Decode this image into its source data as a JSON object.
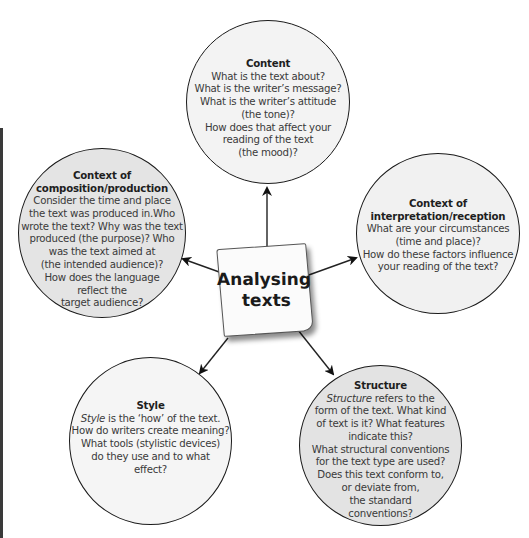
{
  "center": {
    "line1": "Analysing",
    "line2": "texts"
  },
  "colors": {
    "stroke": "#1a1a1a",
    "content_fill": "#f3f3f3",
    "composition_fill": "#e4e4e4",
    "interpretation_fill": "#f1f1f1",
    "style_fill": "#f5f5f5",
    "structure_fill": "#e3e3e3",
    "side_bar": "#3a3a3a"
  },
  "nodes": {
    "content": {
      "title": "Content",
      "lines": [
        "What is the text about?",
        "What is the writer’s message?",
        "What is the writer’s attitude",
        "(the tone)?",
        "How does that affect your",
        "reading of the text",
        "(the mood)?"
      ]
    },
    "composition": {
      "title_line1": "Context of",
      "title_line2": "composition/production",
      "lines": [
        "Consider the time and place",
        "the text was produced in.Who",
        "wrote the text? Why was the text",
        "produced (the purpose)? Who",
        "was the text aimed at",
        "(the intended audience)?",
        "How does the language",
        "reflect the",
        "target audience?"
      ]
    },
    "interpretation": {
      "title_line1": "Context of",
      "title_line2": "interpretation/reception",
      "lines": [
        "What are your circumstances",
        "(time and place)?",
        "How do these factors influence",
        "your reading of the text?"
      ]
    },
    "style": {
      "title": "Style",
      "first_italic": "Style",
      "first_rest": " is the ‘how’ of the text.",
      "lines": [
        "How do writers create meaning?",
        "What tools (stylistic devices)",
        "do they use and to what",
        "effect?"
      ]
    },
    "structure": {
      "title": "Structure",
      "first_italic": "Structure",
      "first_rest": " refers to the",
      "lines": [
        "form of the text. What kind",
        "of text is it? What features",
        "indicate this?",
        "What structural conventions",
        "for the text type are used?",
        "Does this text conform to,",
        "or deviate from,",
        "the standard",
        "conventions?"
      ]
    }
  }
}
